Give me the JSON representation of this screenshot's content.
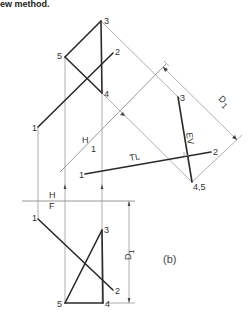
{
  "header_text": "ew method.",
  "caption": "(b)",
  "fold_lines": {
    "hf": {
      "upper": "H",
      "lower": "F"
    },
    "h1": {
      "upper": "H",
      "lower": "1"
    }
  },
  "labels": {
    "tl": "TL",
    "ev": "EV",
    "dimension": "D",
    "dimension_sub": "1"
  },
  "top_view": {
    "points": {
      "p1": "1",
      "p2": "2",
      "p3": "3",
      "p4": "4",
      "p5": "5"
    }
  },
  "auxiliary_view": {
    "points": {
      "p1": "1",
      "p2": "2",
      "p3": "3",
      "p45": "4,5"
    }
  },
  "front_view": {
    "points": {
      "p1": "1",
      "p2": "2",
      "p3": "3",
      "p4": "4",
      "p5": "5"
    }
  },
  "colors": {
    "object_line": "#2a2a2a",
    "construction_line": "#9a9a9a",
    "background": "#ffffff"
  }
}
